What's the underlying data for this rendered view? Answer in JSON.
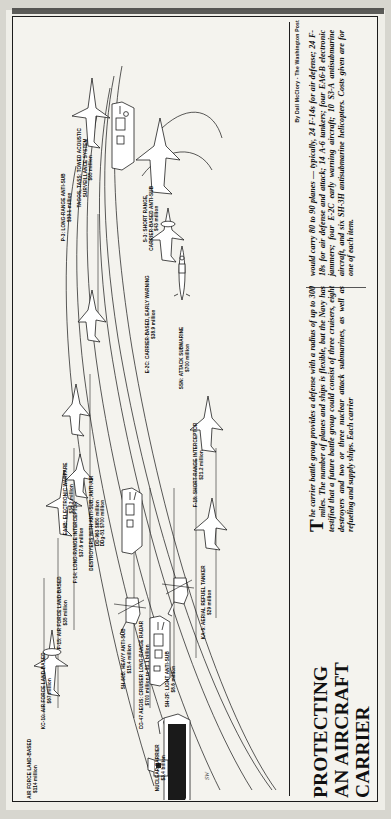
{
  "publication": {
    "byline": "By Dall McClory - The Washington Post",
    "artist_credit": "SW"
  },
  "headline": {
    "line1": "PROTECTING",
    "line2": "AN AIRCRAFT",
    "line3": "CARRIER"
  },
  "body": {
    "dropcap": "T",
    "column1": "he carrier battle group provides a defense with a radius of up to 300 miles. The number of planes and ships is flexible, but the Navy has testified that a future battle group could consist of three cruisers, eight destroyers and two or three nuclear attack submarines, as well as refueling and supply ships. Each carrier",
    "column2": "would carry 80 to 90 planes — typically, 24 F-14s for air defense; 24 F-18s for air defense and attack; 14 A-6 tankers; four EA6-B electronic jammers; four E-2C early warning aircraft; 10 S3-A antisubmarine aircraft, and six SH-3H antisubmarine helicopters. Costs given are for one of each item."
  },
  "diagram": {
    "type": "annotated-illustration",
    "subject": "carrier battle group",
    "items": [
      {
        "id": "awacs",
        "name": "AWACS: AIR FORCE LAND-BASED",
        "cost": "$114 million",
        "icon": "awacs-plane-icon"
      },
      {
        "id": "kc10",
        "name": "KC-10: AIR FORCE LAND-BASED",
        "cost": "$67 million",
        "icon": "tanker-plane-icon"
      },
      {
        "id": "f15",
        "name": "F-15: AIR FORCE LAND-BASED",
        "cost": "$35 million",
        "icon": "fighter-plane-icon"
      },
      {
        "id": "f14",
        "name": "F-14: LONG-RANGE INTERCEPTOR",
        "cost": "$37.6 million",
        "icon": "fighter-plane-icon"
      },
      {
        "id": "p3",
        "name": "P-3: LONG-RANGE ANTI-SUB",
        "cost": "$33.1 million",
        "icon": "patrol-plane-icon"
      },
      {
        "id": "tagos",
        "name": "TAGOS, TASS: TOWED ACOUSTIC SURVEILLANCE SYSTEM",
        "cost": "$65 million",
        "icon": "surveillance-ship-icon"
      },
      {
        "id": "s3",
        "name": "S-3: SHORT RANGE, CARRIER-BASED ANTI-SUB",
        "cost": "$43 million",
        "icon": "antisub-plane-icon"
      },
      {
        "id": "e2c",
        "name": "E-2C: CARRIER-BASED, EARLY WARNING",
        "cost": "$38.9 million",
        "icon": "radar-plane-icon"
      },
      {
        "id": "ssn",
        "name": "SSN: ATTACK SUBMARINE",
        "cost": "$700 million",
        "icon": "submarine-icon"
      },
      {
        "id": "ea6b",
        "name": "EA6B: ELECTRONIC WARFARE",
        "cost": "$34.2 million",
        "icon": "jammer-plane-icon"
      },
      {
        "id": "destroyers",
        "name": "DESTROYERS WITH ANTI-SUB, ANTI-AIR",
        "cost": "DD-963 $650 million\nDDg-51 $700 million",
        "cost_line1": "DD-963 $650 million",
        "cost_line2": "DDg-51 $700 million",
        "icon": "destroyer-ship-icon"
      },
      {
        "id": "f18",
        "name": "F-18: SHORT-RANGE INTERCEPTOR",
        "cost": "$21.2 million",
        "icon": "fighter-plane-icon"
      },
      {
        "id": "ka6",
        "name": "KA-6: AERIAL REFUEL TANKER",
        "cost": "$29 million",
        "icon": "tanker-plane-icon"
      },
      {
        "id": "cg47",
        "name": "CG-47 AEGIS: CRUISER LONG-RANGE RADAR",
        "cost": "$700 million to $1.1 billion",
        "icon": "cruiser-ship-icon"
      },
      {
        "id": "sh2f",
        "name": "SH-2F: LIGHT ANTI-SUB",
        "cost": "$8.6 million",
        "icon": "helicopter-icon"
      },
      {
        "id": "sh60b",
        "name": "SH-60B: HEAVY ANTI-SUB",
        "cost": "$15.4 million",
        "icon": "helicopter-icon"
      },
      {
        "id": "carrier",
        "name": "NUCLEAR CARRIER",
        "cost": "$3.4 billion",
        "icon": "aircraft-carrier-icon"
      }
    ]
  }
}
